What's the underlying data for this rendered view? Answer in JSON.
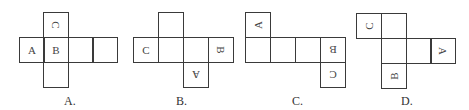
{
  "question": {
    "options": [
      {
        "id": "A",
        "caption": "A.",
        "caption_x": 64,
        "squares": [
          {
            "x": 43,
            "y": 12,
            "letter": "C",
            "rotate": 90
          },
          {
            "x": 19,
            "y": 37,
            "letter": "A",
            "rotate": 0
          },
          {
            "x": 43,
            "y": 37,
            "letter": "B",
            "rotate": 0
          },
          {
            "x": 68,
            "y": 37,
            "letter": "",
            "rotate": 0
          },
          {
            "x": 92,
            "y": 37,
            "letter": "",
            "rotate": 0
          },
          {
            "x": 43,
            "y": 62,
            "letter": "",
            "rotate": 0
          }
        ]
      },
      {
        "id": "B",
        "caption": "B.",
        "caption_x": 176,
        "squares": [
          {
            "x": 158,
            "y": 12,
            "letter": "",
            "rotate": 0
          },
          {
            "x": 133,
            "y": 37,
            "letter": "C",
            "rotate": 0
          },
          {
            "x": 158,
            "y": 37,
            "letter": "",
            "rotate": 0
          },
          {
            "x": 183,
            "y": 37,
            "letter": "",
            "rotate": 0
          },
          {
            "x": 208,
            "y": 37,
            "letter": "B",
            "rotate": 90
          },
          {
            "x": 183,
            "y": 62,
            "letter": "A",
            "rotate": 180
          }
        ]
      },
      {
        "id": "C",
        "caption": "C.",
        "caption_x": 292,
        "squares": [
          {
            "x": 245,
            "y": 12,
            "letter": "A",
            "rotate": -90
          },
          {
            "x": 245,
            "y": 37,
            "letter": "",
            "rotate": 0
          },
          {
            "x": 270,
            "y": 37,
            "letter": "",
            "rotate": 0
          },
          {
            "x": 295,
            "y": 37,
            "letter": "",
            "rotate": 0
          },
          {
            "x": 320,
            "y": 37,
            "letter": "B",
            "rotate": 180
          },
          {
            "x": 320,
            "y": 62,
            "letter": "C",
            "rotate": 180
          }
        ]
      },
      {
        "id": "D",
        "caption": "D.",
        "caption_x": 401,
        "squares": [
          {
            "x": 356,
            "y": 13,
            "letter": "C",
            "rotate": -90
          },
          {
            "x": 381,
            "y": 13,
            "letter": "",
            "rotate": 0
          },
          {
            "x": 381,
            "y": 38,
            "letter": "",
            "rotate": 0
          },
          {
            "x": 406,
            "y": 38,
            "letter": "",
            "rotate": 0
          },
          {
            "x": 430,
            "y": 38,
            "letter": "A",
            "rotate": 90
          },
          {
            "x": 381,
            "y": 63,
            "letter": "B",
            "rotate": -90
          }
        ]
      }
    ]
  }
}
